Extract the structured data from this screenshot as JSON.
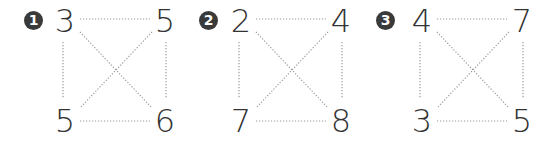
{
  "exercise": {
    "line_color": "#9a9a9a",
    "badge_color": "#3a3a3a",
    "number_color": "#333333",
    "panels": [
      {
        "label": "1",
        "top_left": "3",
        "top_right": "5",
        "bottom_left": "5",
        "bottom_right": "6"
      },
      {
        "label": "2",
        "top_left": "2",
        "top_right": "4",
        "bottom_left": "7",
        "bottom_right": "8"
      },
      {
        "label": "3",
        "top_left": "4",
        "top_right": "7",
        "bottom_left": "3",
        "bottom_right": "5"
      }
    ]
  }
}
